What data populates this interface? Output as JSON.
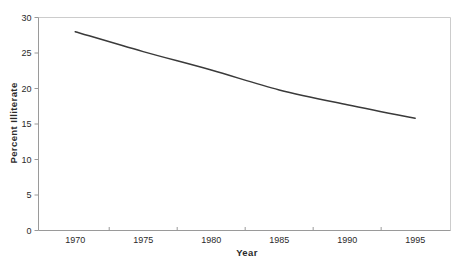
{
  "figure": {
    "background": "#ffffff",
    "line_color": "#3a3a3a",
    "frame_color": "#cccccc",
    "axis_color": "#9a9a9a",
    "tick_text_color": "#2a2a2a"
  },
  "chart_data": {
    "type": "line",
    "x": [
      1970,
      1975,
      1980,
      1985,
      1990,
      1995
    ],
    "values": [
      28.0,
      25.2,
      22.6,
      19.8,
      17.7,
      15.8
    ],
    "series_name": "Percent Illiterate",
    "title": "",
    "xlabel": "Year",
    "ylabel": "Percent Illiterate",
    "xlim": [
      1967.3,
      1997.6
    ],
    "ylim": [
      0,
      30
    ],
    "y_ticks": [
      0,
      5,
      10,
      15,
      20,
      25,
      30
    ],
    "x_ticks": [
      1970,
      1975,
      1980,
      1985,
      1990,
      1995
    ],
    "grid": false,
    "legend": false,
    "frame": "top-right-light"
  }
}
